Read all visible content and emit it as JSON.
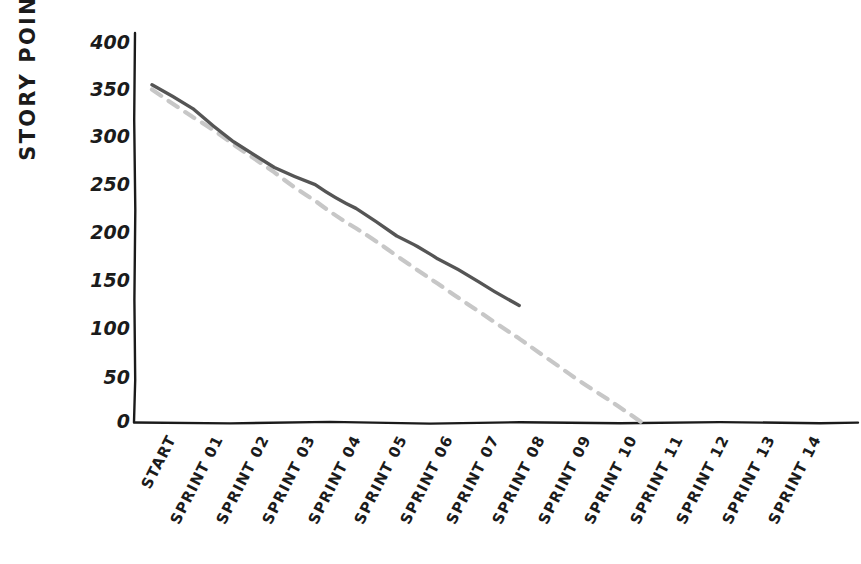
{
  "chart_data": {
    "type": "line",
    "title": "",
    "xlabel": "",
    "ylabel": "STORY POINTS",
    "style": "hand-drawn sketch",
    "categories": [
      "START",
      "SPRINT 01",
      "SPRINT 02",
      "SPRINT 03",
      "SPRINT 04",
      "SPRINT 05",
      "SPRINT 06",
      "SPRINT 07",
      "SPRINT 08",
      "SPRINT 09",
      "SPRINT 10",
      "SPRINT 11",
      "SPRINT 12",
      "SPRINT 13",
      "SPRINT 14"
    ],
    "ylim": [
      0,
      400
    ],
    "xlim_categories": [
      0,
      14
    ],
    "yticks": [
      0,
      50,
      100,
      150,
      200,
      250,
      300,
      350,
      400
    ],
    "ytick_labels": [
      "0",
      "50",
      "100",
      "150",
      "200",
      "250",
      "300",
      "350",
      "400"
    ],
    "grid": false,
    "legend": "none",
    "series": [
      {
        "name": "Actual remaining",
        "line_style": "solid",
        "color": "#555555",
        "values": [
          355,
          330,
          295,
          268,
          250,
          225,
          196,
          172,
          148,
          123,
          null,
          null,
          null,
          null,
          null
        ]
      },
      {
        "name": "Ideal burndown",
        "line_style": "dashed",
        "color": "#c7c7c7",
        "values": [
          350,
          321,
          292,
          263,
          233,
          204,
          175,
          146,
          117,
          88,
          58,
          29,
          0,
          null,
          null
        ]
      }
    ]
  },
  "axis": {
    "y_title": "STORY POINTS",
    "y_tick_labels": [
      "400",
      "350",
      "300",
      "250",
      "200",
      "150",
      "100",
      "50",
      "0"
    ],
    "x_tick_labels": [
      "START",
      "SPRINT 01",
      "SPRINT 02",
      "SPRINT 03",
      "SPRINT 04",
      "SPRINT 05",
      "SPRINT 06",
      "SPRINT 07",
      "SPRINT 08",
      "SPRINT 09",
      "SPRINT 10",
      "SPRINT 11",
      "SPRINT 12",
      "SPRINT 13",
      "SPRINT 14"
    ]
  },
  "colors": {
    "actual_line": "#555555",
    "ideal_line": "#c7c7c7",
    "axis": "#1b1b1b",
    "background": "#ffffff"
  },
  "header": {
    "title": ""
  }
}
